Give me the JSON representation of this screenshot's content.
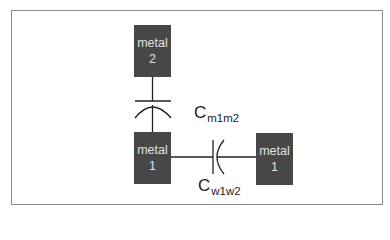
{
  "diagram": {
    "nodes": [
      {
        "id": "metal2_top",
        "line1": "metal",
        "line2": "2"
      },
      {
        "id": "metal1_left",
        "line1": "metal",
        "line2": "1"
      },
      {
        "id": "metal1_right",
        "line1": "metal",
        "line2": "1"
      }
    ],
    "capacitors": [
      {
        "id": "c_m1m2",
        "base": "C",
        "subscript": "m1m2",
        "between": [
          "metal2_top",
          "metal1_left"
        ],
        "orientation": "vertical"
      },
      {
        "id": "c_w1w2",
        "base": "C",
        "subscript": "w1w2",
        "between": [
          "metal1_left",
          "metal1_right"
        ],
        "orientation": "horizontal"
      }
    ],
    "colors": {
      "box_fill": "#474747",
      "box_text": "#e2e2e2",
      "wire": "#222222",
      "frame": "#8a8a8a"
    }
  }
}
